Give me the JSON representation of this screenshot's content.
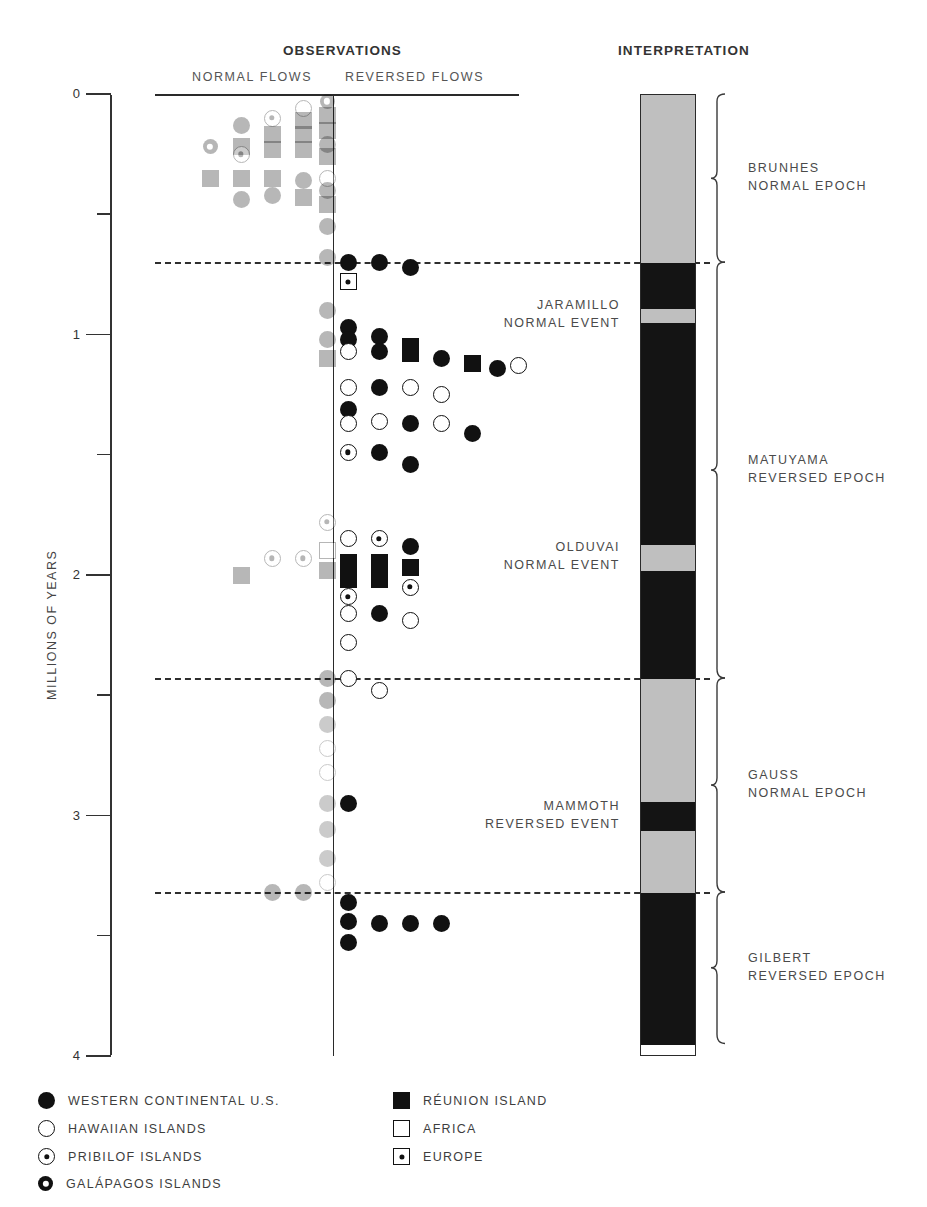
{
  "headers": {
    "observations": "OBSERVATIONS",
    "interpretation": "INTERPRETATION",
    "normal_flows": "NORMAL FLOWS",
    "reversed_flows": "REVERSED FLOWS"
  },
  "axis": {
    "label": "MILLIONS OF YEARS",
    "ticks": [
      "0",
      "1",
      "2",
      "3",
      "4"
    ],
    "min": 0,
    "max": 4
  },
  "legend": {
    "left": [
      {
        "symbol": "circle-filled",
        "label": "WESTERN CONTINENTAL U.S."
      },
      {
        "symbol": "circle-open",
        "label": "HAWAIIAN ISLANDS"
      },
      {
        "symbol": "circle-dot",
        "label": "PRIBILOF ISLANDS"
      },
      {
        "symbol": "circle-ring",
        "label": "GALÁPAGOS ISLANDS"
      }
    ],
    "right": [
      {
        "symbol": "square-filled",
        "label": "RÉUNION ISLAND"
      },
      {
        "symbol": "square-open",
        "label": "AFRICA"
      },
      {
        "symbol": "square-dot",
        "label": "EUROPE"
      }
    ]
  },
  "epochs": [
    {
      "name": "BRUNHES",
      "kind": "NORMAL EPOCH",
      "start": 0.0,
      "end": 0.7
    },
    {
      "name": "MATUYAMA",
      "kind": "REVERSED EPOCH",
      "start": 0.7,
      "end": 2.43
    },
    {
      "name": "GAUSS",
      "kind": "NORMAL EPOCH",
      "start": 2.43,
      "end": 3.32
    },
    {
      "name": "GILBERT",
      "kind": "REVERSED EPOCH",
      "start": 3.32,
      "end": 3.95
    }
  ],
  "events": [
    {
      "name": "JARAMILLO",
      "kind": "NORMAL EVENT",
      "start": 0.89,
      "end": 0.95
    },
    {
      "name": "OLDUVAI",
      "kind": "NORMAL EVENT",
      "start": 1.87,
      "end": 1.98
    },
    {
      "name": "MAMMOTH",
      "kind": "REVERSED EVENT",
      "start": 2.94,
      "end": 3.06
    }
  ],
  "polarity_bands": [
    {
      "polarity": "normal",
      "start": 0.0,
      "end": 0.7
    },
    {
      "polarity": "reversed",
      "start": 0.7,
      "end": 0.89
    },
    {
      "polarity": "normal",
      "start": 0.89,
      "end": 0.95
    },
    {
      "polarity": "reversed",
      "start": 0.95,
      "end": 1.87
    },
    {
      "polarity": "normal",
      "start": 1.87,
      "end": 1.98
    },
    {
      "polarity": "reversed",
      "start": 1.98,
      "end": 2.43
    },
    {
      "polarity": "normal",
      "start": 2.43,
      "end": 2.94
    },
    {
      "polarity": "reversed",
      "start": 2.94,
      "end": 3.06
    },
    {
      "polarity": "normal",
      "start": 3.06,
      "end": 3.32
    },
    {
      "polarity": "reversed",
      "start": 3.32,
      "end": 3.95
    }
  ],
  "boundaries": [
    0.7,
    2.43,
    3.32
  ],
  "chart_data": {
    "type": "scatter",
    "xlabel": "",
    "ylabel": "MILLIONS OF YEARS",
    "ylim": [
      0,
      4
    ],
    "y_inverted": true,
    "grid": false,
    "columns": [
      "NORMAL FLOWS",
      "REVERSED FLOWS"
    ],
    "legend_position": "below",
    "series": [
      {
        "name": "WESTERN CONTINENTAL U.S.",
        "symbol": "circle-filled"
      },
      {
        "name": "HAWAIIAN ISLANDS",
        "symbol": "circle-open"
      },
      {
        "name": "PRIBILOF ISLANDS",
        "symbol": "circle-dot"
      },
      {
        "name": "GALÁPAGOS ISLANDS",
        "symbol": "circle-ring"
      },
      {
        "name": "RÉUNION ISLAND",
        "symbol": "square-filled"
      },
      {
        "name": "AFRICA",
        "symbol": "square-open"
      },
      {
        "name": "EUROPE",
        "symbol": "square-dot"
      }
    ],
    "normal_flows": [
      {
        "slot": 4,
        "age": 0.03,
        "symbol": "circle-ring"
      },
      {
        "slot": 3,
        "age": 0.06,
        "symbol": "circle-open"
      },
      {
        "slot": 4,
        "age": 0.09,
        "symbol": "square-filled"
      },
      {
        "slot": 2,
        "age": 0.1,
        "symbol": "circle-dot"
      },
      {
        "slot": 3,
        "age": 0.11,
        "symbol": "square-filled"
      },
      {
        "slot": 1,
        "age": 0.13,
        "symbol": "circle-filled"
      },
      {
        "slot": 4,
        "age": 0.15,
        "symbol": "square-filled"
      },
      {
        "slot": 2,
        "age": 0.17,
        "symbol": "square-filled"
      },
      {
        "slot": 3,
        "age": 0.17,
        "symbol": "square-filled"
      },
      {
        "slot": 4,
        "age": 0.21,
        "symbol": "circle-filled"
      },
      {
        "slot": 0,
        "age": 0.22,
        "symbol": "circle-ring"
      },
      {
        "slot": 1,
        "age": 0.22,
        "symbol": "square-filled"
      },
      {
        "slot": 2,
        "age": 0.23,
        "symbol": "square-filled"
      },
      {
        "slot": 3,
        "age": 0.23,
        "symbol": "square-filled"
      },
      {
        "slot": 1,
        "age": 0.25,
        "symbol": "circle-dot"
      },
      {
        "slot": 4,
        "age": 0.26,
        "symbol": "square-filled"
      },
      {
        "slot": 0,
        "age": 0.35,
        "symbol": "square-filled"
      },
      {
        "slot": 1,
        "age": 0.35,
        "symbol": "square-filled"
      },
      {
        "slot": 2,
        "age": 0.35,
        "symbol": "square-filled"
      },
      {
        "slot": 3,
        "age": 0.36,
        "symbol": "circle-filled"
      },
      {
        "slot": 4,
        "age": 0.35,
        "symbol": "circle-open"
      },
      {
        "slot": 4,
        "age": 0.4,
        "symbol": "circle-filled"
      },
      {
        "slot": 2,
        "age": 0.42,
        "symbol": "circle-filled"
      },
      {
        "slot": 1,
        "age": 0.44,
        "symbol": "circle-filled"
      },
      {
        "slot": 3,
        "age": 0.43,
        "symbol": "square-filled"
      },
      {
        "slot": 4,
        "age": 0.46,
        "symbol": "square-filled"
      },
      {
        "slot": 4,
        "age": 0.55,
        "symbol": "circle-filled"
      },
      {
        "slot": 4,
        "age": 0.68,
        "symbol": "circle-filled"
      },
      {
        "slot": 4,
        "age": 0.9,
        "symbol": "circle-filled"
      },
      {
        "slot": 4,
        "age": 1.02,
        "symbol": "circle-filled"
      },
      {
        "slot": 4,
        "age": 1.1,
        "symbol": "square-filled"
      },
      {
        "slot": 4,
        "age": 1.78,
        "symbol": "circle-dot"
      },
      {
        "slot": 2,
        "age": 1.93,
        "symbol": "circle-dot"
      },
      {
        "slot": 3,
        "age": 1.93,
        "symbol": "circle-dot"
      },
      {
        "slot": 4,
        "age": 1.9,
        "symbol": "square-open"
      },
      {
        "slot": 1,
        "age": 2.0,
        "symbol": "square-filled"
      },
      {
        "slot": 4,
        "age": 1.98,
        "symbol": "square-filled"
      },
      {
        "slot": 4,
        "age": 2.43,
        "symbol": "circle-filled"
      },
      {
        "slot": 4,
        "age": 2.52,
        "symbol": "circle-filled"
      },
      {
        "slot": 4,
        "age": 2.62,
        "symbol": "circle-filled"
      },
      {
        "slot": 4,
        "age": 2.72,
        "symbol": "circle-open"
      },
      {
        "slot": 4,
        "age": 2.82,
        "symbol": "circle-open"
      },
      {
        "slot": 4,
        "age": 2.95,
        "symbol": "circle-filled"
      },
      {
        "slot": 4,
        "age": 3.06,
        "symbol": "circle-filled"
      },
      {
        "slot": 4,
        "age": 3.18,
        "symbol": "circle-filled"
      },
      {
        "slot": 4,
        "age": 3.28,
        "symbol": "circle-open"
      },
      {
        "slot": 2,
        "age": 3.32,
        "symbol": "circle-filled"
      },
      {
        "slot": 3,
        "age": 3.32,
        "symbol": "circle-filled"
      }
    ],
    "reversed_flows": [
      {
        "slot": 0,
        "age": 0.7,
        "symbol": "circle-filled"
      },
      {
        "slot": 1,
        "age": 0.7,
        "symbol": "circle-filled"
      },
      {
        "slot": 2,
        "age": 0.72,
        "symbol": "circle-filled"
      },
      {
        "slot": 0,
        "age": 0.78,
        "symbol": "square-dot"
      },
      {
        "slot": 0,
        "age": 0.97,
        "symbol": "circle-filled"
      },
      {
        "slot": 0,
        "age": 1.02,
        "symbol": "circle-filled"
      },
      {
        "slot": 1,
        "age": 1.01,
        "symbol": "circle-filled"
      },
      {
        "slot": 0,
        "age": 1.07,
        "symbol": "circle-open"
      },
      {
        "slot": 1,
        "age": 1.07,
        "symbol": "circle-filled"
      },
      {
        "slot": 2,
        "age": 1.05,
        "symbol": "square-filled"
      },
      {
        "slot": 2,
        "age": 1.08,
        "symbol": "square-filled"
      },
      {
        "slot": 3,
        "age": 1.1,
        "symbol": "circle-filled"
      },
      {
        "slot": 4,
        "age": 1.12,
        "symbol": "square-filled"
      },
      {
        "slot": 5,
        "age": 1.14,
        "symbol": "circle-filled"
      },
      {
        "slot": 6,
        "age": 1.13,
        "symbol": "circle-open"
      },
      {
        "slot": 0,
        "age": 1.22,
        "symbol": "circle-open"
      },
      {
        "slot": 1,
        "age": 1.22,
        "symbol": "circle-filled"
      },
      {
        "slot": 2,
        "age": 1.22,
        "symbol": "circle-open"
      },
      {
        "slot": 3,
        "age": 1.25,
        "symbol": "circle-open"
      },
      {
        "slot": 0,
        "age": 1.31,
        "symbol": "circle-filled"
      },
      {
        "slot": 0,
        "age": 1.37,
        "symbol": "circle-open"
      },
      {
        "slot": 1,
        "age": 1.36,
        "symbol": "circle-open"
      },
      {
        "slot": 2,
        "age": 1.37,
        "symbol": "circle-filled"
      },
      {
        "slot": 3,
        "age": 1.37,
        "symbol": "circle-open"
      },
      {
        "slot": 4,
        "age": 1.41,
        "symbol": "circle-filled"
      },
      {
        "slot": 0,
        "age": 1.49,
        "symbol": "circle-dot"
      },
      {
        "slot": 1,
        "age": 1.49,
        "symbol": "circle-filled"
      },
      {
        "slot": 2,
        "age": 1.54,
        "symbol": "circle-filled"
      },
      {
        "slot": 0,
        "age": 1.85,
        "symbol": "circle-open"
      },
      {
        "slot": 1,
        "age": 1.85,
        "symbol": "circle-dot"
      },
      {
        "slot": 2,
        "age": 1.88,
        "symbol": "circle-filled"
      },
      {
        "slot": 0,
        "age": 1.95,
        "symbol": "square-filled"
      },
      {
        "slot": 1,
        "age": 1.95,
        "symbol": "square-filled"
      },
      {
        "slot": 2,
        "age": 1.97,
        "symbol": "square-filled"
      },
      {
        "slot": 0,
        "age": 2.02,
        "symbol": "square-filled"
      },
      {
        "slot": 1,
        "age": 2.02,
        "symbol": "square-filled"
      },
      {
        "slot": 2,
        "age": 2.05,
        "symbol": "circle-dot"
      },
      {
        "slot": 0,
        "age": 2.09,
        "symbol": "circle-dot"
      },
      {
        "slot": 0,
        "age": 2.16,
        "symbol": "circle-open"
      },
      {
        "slot": 1,
        "age": 2.16,
        "symbol": "circle-filled"
      },
      {
        "slot": 2,
        "age": 2.19,
        "symbol": "circle-open"
      },
      {
        "slot": 0,
        "age": 2.28,
        "symbol": "circle-open"
      },
      {
        "slot": 0,
        "age": 2.43,
        "symbol": "circle-open"
      },
      {
        "slot": 1,
        "age": 2.48,
        "symbol": "circle-open"
      },
      {
        "slot": 0,
        "age": 2.95,
        "symbol": "circle-filled"
      },
      {
        "slot": 0,
        "age": 3.36,
        "symbol": "circle-filled"
      },
      {
        "slot": 0,
        "age": 3.44,
        "symbol": "circle-filled"
      },
      {
        "slot": 1,
        "age": 3.45,
        "symbol": "circle-filled"
      },
      {
        "slot": 2,
        "age": 3.45,
        "symbol": "circle-filled"
      },
      {
        "slot": 3,
        "age": 3.45,
        "symbol": "circle-filled"
      },
      {
        "slot": 0,
        "age": 3.53,
        "symbol": "circle-filled"
      }
    ]
  }
}
